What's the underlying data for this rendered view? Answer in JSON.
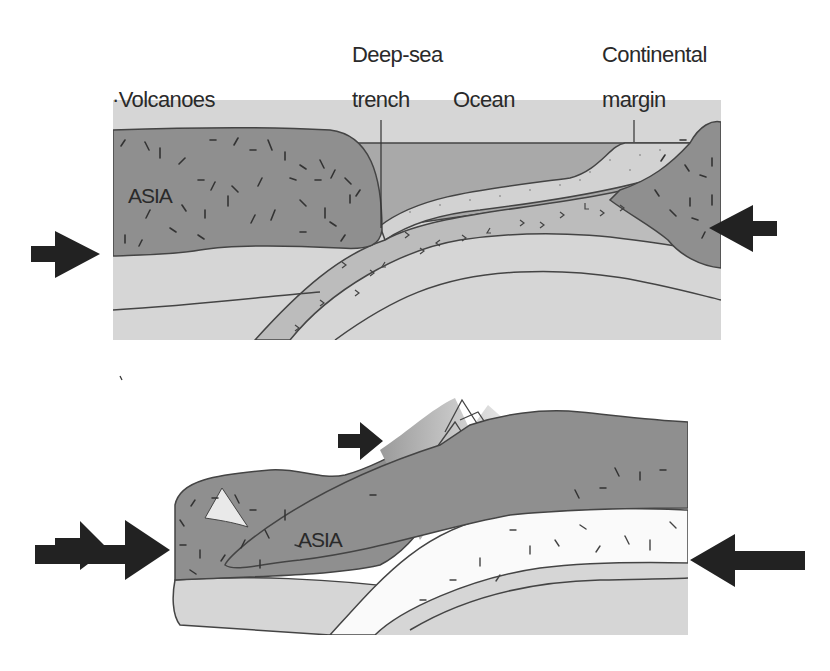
{
  "diagram": {
    "colors": {
      "continental_crust": "#8f8f8f",
      "mantle": "#d6d6d6",
      "ocean_water": "#a9a9a9",
      "oceanic_crust": "#bcbcbc",
      "sediment": "#d2d2d2",
      "indian_crust": "#fafafa",
      "outline": "#444444",
      "arrow": "#222222"
    },
    "top_panel": {
      "name": "Subduction stage",
      "labels": {
        "volcanoes": "·Volcanoes",
        "deep_sea_line1": "Deep-sea",
        "deep_sea_line2": "trench",
        "ocean": "Ocean",
        "continental_line1": "Continental",
        "continental_line2": "margin",
        "asia": "ASIA"
      },
      "arrows": [
        {
          "position": "left",
          "direction": "right"
        },
        {
          "position": "right",
          "direction": "left"
        }
      ]
    },
    "bottom_panel": {
      "name": "Collision stage",
      "labels": {
        "asia": "ASIA"
      },
      "arrows": [
        {
          "position": "left",
          "direction": "right"
        },
        {
          "position": "top-center",
          "direction": "right"
        },
        {
          "position": "right",
          "direction": "left"
        }
      ]
    }
  }
}
